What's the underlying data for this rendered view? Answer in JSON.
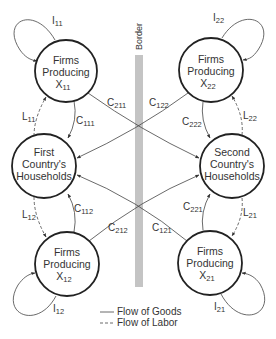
{
  "border": {
    "label": "Border",
    "color": "#bdbdbd"
  },
  "nodes": {
    "firms_x11": {
      "line1": "Firms",
      "line2": "Producing",
      "var": "X",
      "sub": "11"
    },
    "firms_x22": {
      "line1": "Firms",
      "line2": "Producing",
      "var": "X",
      "sub": "22"
    },
    "first_households": {
      "line1": "First",
      "line2": "Country's",
      "line3": "Households"
    },
    "second_households": {
      "line1": "Second",
      "line2": "Country's",
      "line3": "Households"
    },
    "firms_x12": {
      "line1": "Firms",
      "line2": "Producing",
      "var": "X",
      "sub": "12"
    },
    "firms_x21": {
      "line1": "Firms",
      "line2": "Producing",
      "var": "X",
      "sub": "21"
    }
  },
  "flows": {
    "I11": {
      "var": "I",
      "sub": "11",
      "type": "goods"
    },
    "I22": {
      "var": "I",
      "sub": "22",
      "type": "goods"
    },
    "I12": {
      "var": "I",
      "sub": "12",
      "type": "goods"
    },
    "I21": {
      "var": "I",
      "sub": "21",
      "type": "goods"
    },
    "L11": {
      "var": "L",
      "sub": "11",
      "type": "labor"
    },
    "L22": {
      "var": "L",
      "sub": "22",
      "type": "labor"
    },
    "L12": {
      "var": "L",
      "sub": "12",
      "type": "labor"
    },
    "L21": {
      "var": "L",
      "sub": "21",
      "type": "labor"
    },
    "C111": {
      "var": "C",
      "sub": "111",
      "type": "goods"
    },
    "C222": {
      "var": "C",
      "sub": "222",
      "type": "goods"
    },
    "C112": {
      "var": "C",
      "sub": "112",
      "type": "goods"
    },
    "C221": {
      "var": "C",
      "sub": "221",
      "type": "goods"
    },
    "C211": {
      "var": "C",
      "sub": "211",
      "type": "goods"
    },
    "C122": {
      "var": "C",
      "sub": "122",
      "type": "goods"
    },
    "C212": {
      "var": "C",
      "sub": "212",
      "type": "goods"
    },
    "C121": {
      "var": "C",
      "sub": "121",
      "type": "goods"
    }
  },
  "legend": {
    "goods": "Flow of Goods",
    "labor": "Flow of Labor"
  }
}
